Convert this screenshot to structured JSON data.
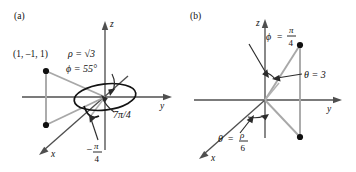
{
  "figure": {
    "caption_note": "Spherical coordinate diagrams",
    "background_color": "#ffffff",
    "gray_color": "#a8a8a8",
    "axis_color": "#4f4f4f",
    "ink_color": "#101010"
  },
  "panels": [
    {
      "tag": "(a)",
      "axes": {
        "z": "z",
        "y": "y",
        "x": "x"
      },
      "point_label": "(1, –1, 1)",
      "annotations": {
        "rho": {
          "symbol": "ρ",
          "equals": "=",
          "value": "√3",
          "full": "ρ = √3"
        },
        "phi": {
          "symbol": "ϕ",
          "equals": "=",
          "value": "55",
          "degree": "°",
          "full": "ϕ = 55°"
        },
        "theta_positive": {
          "full": "7π/4",
          "numerator": "7π",
          "denominator": "4"
        },
        "theta_negative": {
          "sign": "–",
          "numerator": "π",
          "denominator": "4",
          "full": "–π/4"
        }
      }
    },
    {
      "tag": "(b)",
      "axes": {
        "z": "z",
        "y": "y",
        "x": "x"
      },
      "annotations": {
        "phi": {
          "symbol": "ϕ",
          "equals": "=",
          "numerator": "π",
          "denominator": "4",
          "full": "ϕ = π/4"
        },
        "theta_value": {
          "symbol": "θ",
          "equals": "=",
          "value": "3",
          "full": "θ = 3"
        },
        "theta_fraction": {
          "symbol": "θ",
          "equals": "=",
          "numerator": "ρ",
          "denominator": "6",
          "full": "θ = ρ/6"
        }
      }
    }
  ]
}
